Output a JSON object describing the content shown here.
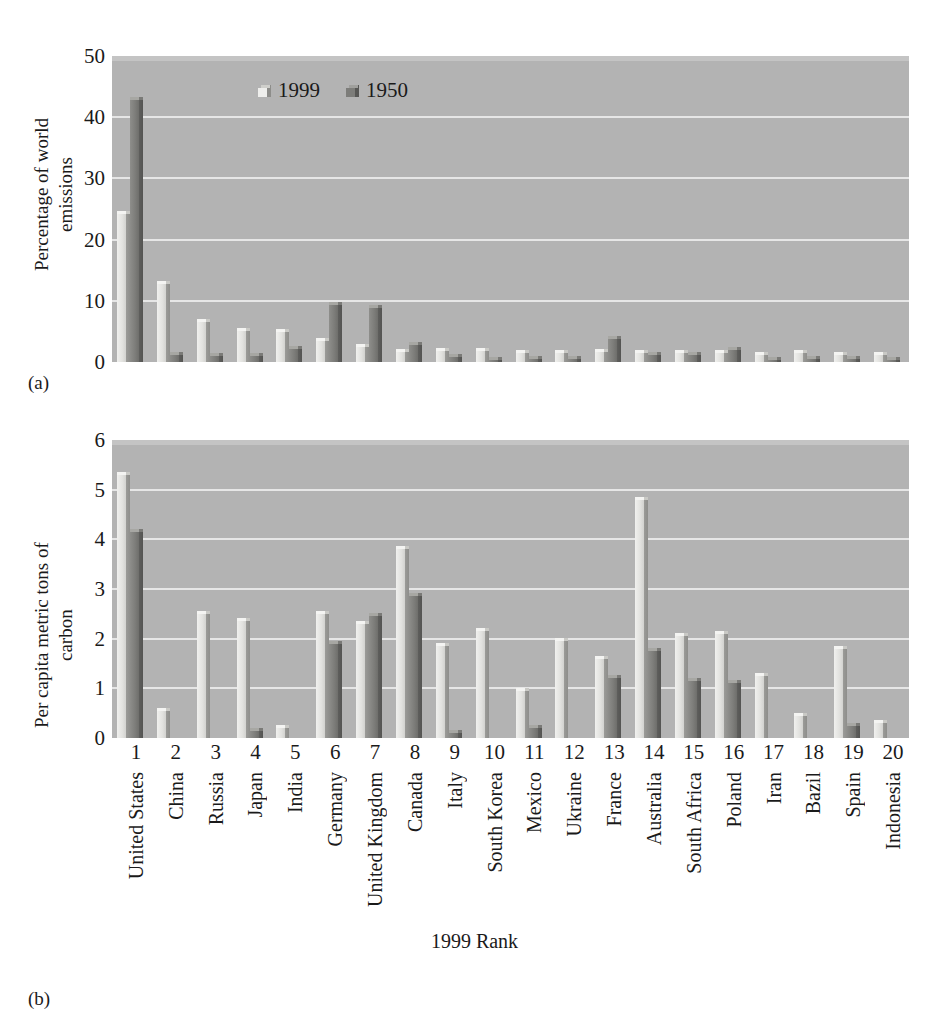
{
  "figure": {
    "panel_a_tag": "(a)",
    "panel_b_tag": "(b)",
    "xaxis_title": "1999 Rank"
  },
  "legend": {
    "entries": [
      {
        "label": "1999",
        "series": "s1999"
      },
      {
        "label": "1950",
        "series": "s1950"
      }
    ]
  },
  "chart_data": [
    {
      "type": "bar",
      "panel": "(a)",
      "title": "",
      "xlabel": "1999 Rank",
      "ylabel": "Percentage of world emissions",
      "ylim": [
        0,
        50
      ],
      "yticks": [
        0,
        10,
        20,
        30,
        40,
        50
      ],
      "grid": true,
      "legend_position": "top-center-inside",
      "categories": [
        "United States",
        "China",
        "Russia",
        "Japan",
        "India",
        "Germany",
        "United Kingdom",
        "Canada",
        "Italy",
        "South Korea",
        "Mexico",
        "Ukraine",
        "France",
        "Australia",
        "South Africa",
        "Poland",
        "Iran",
        "Bazil",
        "Spain",
        "Indonesia"
      ],
      "ranks": [
        "1",
        "2",
        "3",
        "4",
        "5",
        "6",
        "7",
        "8",
        "9",
        "10",
        "11",
        "12",
        "13",
        "14",
        "15",
        "16",
        "17",
        "18",
        "19",
        "20"
      ],
      "series": [
        {
          "name": "1999",
          "values": [
            24.2,
            12.7,
            6.6,
            5.0,
            4.9,
            3.5,
            2.4,
            1.7,
            1.8,
            1.8,
            1.5,
            1.4,
            1.6,
            1.4,
            1.5,
            1.4,
            1.2,
            1.4,
            1.2,
            1.1
          ]
        },
        {
          "name": "1950",
          "values": [
            42.8,
            1.2,
            1.0,
            1.0,
            2.2,
            9.3,
            8.8,
            2.8,
            0.8,
            0.3,
            0.5,
            0.5,
            3.8,
            1.2,
            1.2,
            1.9,
            0.1,
            0.5,
            0.5,
            0.2
          ]
        }
      ]
    },
    {
      "type": "bar",
      "panel": "(b)",
      "title": "",
      "xlabel": "1999 Rank",
      "ylabel": "Per capita metric tons of carbon",
      "ylim": [
        0,
        6
      ],
      "yticks": [
        0,
        1,
        2,
        3,
        4,
        5,
        6
      ],
      "grid": true,
      "legend_position": "none",
      "categories": [
        "United States",
        "China",
        "Russia",
        "Japan",
        "India",
        "Germany",
        "United Kingdom",
        "Canada",
        "Italy",
        "South Korea",
        "Mexico",
        "Ukraine",
        "France",
        "Australia",
        "South Africa",
        "Poland",
        "Iran",
        "Bazil",
        "Spain",
        "Indonesia"
      ],
      "ranks": [
        "1",
        "2",
        "3",
        "4",
        "5",
        "6",
        "7",
        "8",
        "9",
        "10",
        "11",
        "12",
        "13",
        "14",
        "15",
        "16",
        "17",
        "18",
        "19",
        "20"
      ],
      "series": [
        {
          "name": "1999",
          "values": [
            5.3,
            0.55,
            2.5,
            2.35,
            0.2,
            2.5,
            2.3,
            3.8,
            1.85,
            2.15,
            0.95,
            1.95,
            1.6,
            4.8,
            2.05,
            2.1,
            1.25,
            0.45,
            1.8,
            0.3
          ]
        },
        {
          "name": "1950",
          "values": [
            4.15,
            0.0,
            0.0,
            0.15,
            0.0,
            1.9,
            2.45,
            2.85,
            0.1,
            0.0,
            0.2,
            0.0,
            1.2,
            1.75,
            1.15,
            1.1,
            0.0,
            0.0,
            0.25,
            0.0
          ]
        }
      ]
    }
  ]
}
